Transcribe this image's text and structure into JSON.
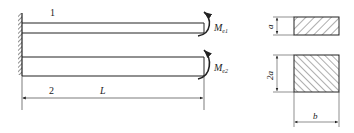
{
  "diagram": {
    "beams": [
      {
        "id": "beam-1",
        "label": "1",
        "moment_label": "M",
        "moment_sub": "e1"
      },
      {
        "id": "beam-2",
        "label": "2",
        "moment_label": "M",
        "moment_sub": "e2"
      }
    ],
    "length_label": "L",
    "sections": [
      {
        "id": "section-1",
        "height_label": "a"
      },
      {
        "id": "section-2",
        "height_label": "2a",
        "width_label": "b"
      }
    ]
  },
  "colors": {
    "line": "#222222",
    "background": "#ffffff"
  }
}
